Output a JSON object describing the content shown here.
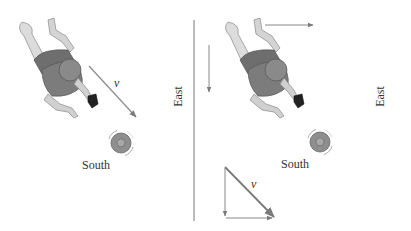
{
  "figure": {
    "left_panel": {
      "direction_south_label": "South",
      "direction_east_label": "East",
      "velocity_label": "v"
    },
    "right_panel": {
      "direction_south_label": "South",
      "direction_east_label": "East",
      "velocity_label": "v"
    },
    "colors": {
      "line": "#8a8a8a",
      "shirt": "#7a7a7a",
      "skin": "#cfcfcf",
      "ball": "#8c8c8c",
      "text": "#333333"
    }
  }
}
